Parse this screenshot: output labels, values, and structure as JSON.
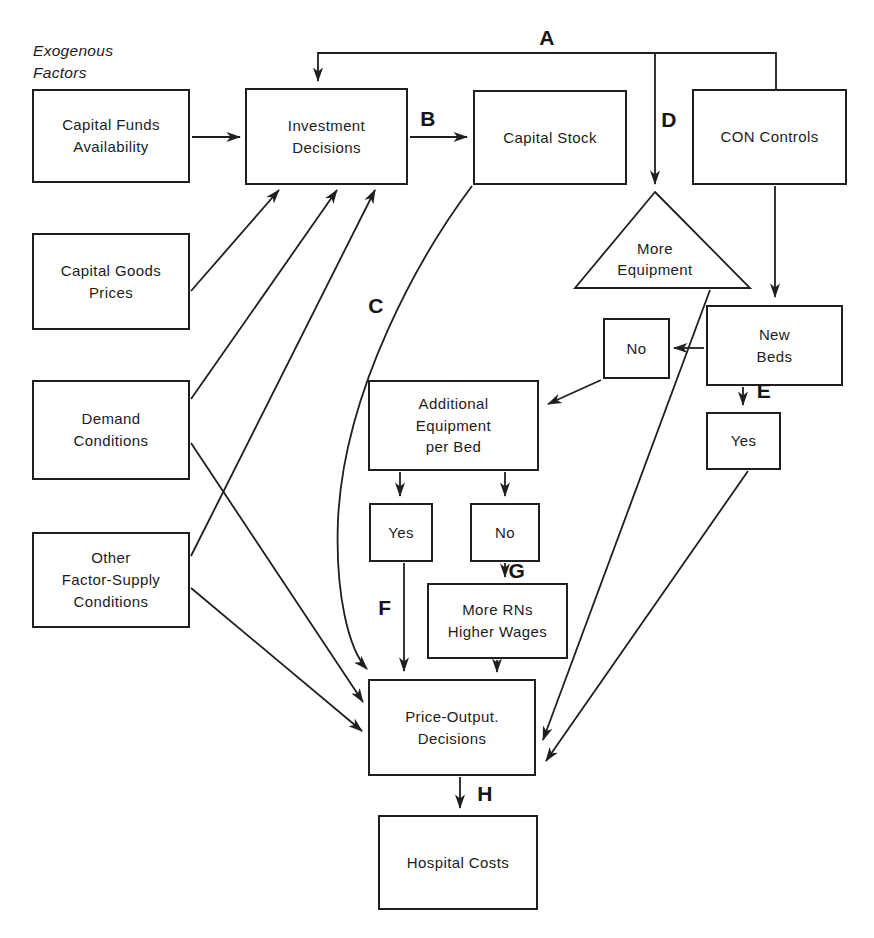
{
  "meta": {
    "figure_type": "flowchart",
    "topic": "hospital cost determination"
  },
  "colors": {
    "background": "#ffffff",
    "line": "#1f1f1f",
    "box_fill": "#ffffff",
    "text": "#1c1c1c"
  },
  "annotations": {
    "exogenous_factors": "Exogenous\nFactors"
  },
  "nodes": {
    "capital_funds_availability": {
      "label": "Capital Funds\nAvailability",
      "shape": "rect"
    },
    "investment_decisions": {
      "label": "Investment\nDecisions",
      "shape": "rect"
    },
    "capital_stock": {
      "label": "Capital Stock",
      "shape": "rect"
    },
    "con_controls": {
      "label": "CON Controls",
      "shape": "rect"
    },
    "capital_goods_prices": {
      "label": "Capital Goods\nPrices",
      "shape": "rect"
    },
    "demand_conditions": {
      "label": "Demand\nConditions",
      "shape": "rect"
    },
    "other_factor_supply_conditions": {
      "label": "Other\nFactor-Supply\nConditions",
      "shape": "rect"
    },
    "more_equipment": {
      "label": "More\nEquipment",
      "shape": "triangle"
    },
    "new_beds": {
      "label": "New\nBeds",
      "shape": "rect"
    },
    "no_new_beds": {
      "label": "No",
      "shape": "rect"
    },
    "yes_new_beds": {
      "label": "Yes",
      "shape": "rect"
    },
    "additional_equipment_per_bed": {
      "label": "Additional\nEquipment\nper Bed",
      "shape": "rect"
    },
    "yes_additional_equipment": {
      "label": "Yes",
      "shape": "rect"
    },
    "no_additional_equipment": {
      "label": "No",
      "shape": "rect"
    },
    "more_rns_higher_wages": {
      "label": "More RNs\nHigher Wages",
      "shape": "rect"
    },
    "price_output_decisions": {
      "label": "Price-Output.\nDecisions",
      "shape": "rect"
    },
    "hospital_costs": {
      "label": "Hospital Costs",
      "shape": "rect"
    }
  },
  "edge_labels": {
    "A": "A",
    "B": "B",
    "C": "C",
    "D": "D",
    "E": "E",
    "F": "F",
    "G": "G",
    "H": "H"
  },
  "edges": [
    {
      "from": "capital_funds_availability",
      "to": "investment_decisions",
      "label": ""
    },
    {
      "from": "con_controls",
      "to": "investment_decisions",
      "label": "A"
    },
    {
      "from": "investment_decisions",
      "to": "capital_stock",
      "label": "B"
    },
    {
      "from": "capital_stock",
      "to": "price_output_decisions",
      "label": "C"
    },
    {
      "from": "con_controls",
      "to": "more_equipment",
      "label": "D"
    },
    {
      "from": "con_controls",
      "to": "new_beds",
      "label": ""
    },
    {
      "from": "new_beds",
      "to": "no_new_beds",
      "label": ""
    },
    {
      "from": "new_beds",
      "to": "yes_new_beds",
      "label": "E"
    },
    {
      "from": "no_new_beds",
      "to": "additional_equipment_per_bed",
      "label": ""
    },
    {
      "from": "additional_equipment_per_bed",
      "to": "yes_additional_equipment",
      "label": ""
    },
    {
      "from": "additional_equipment_per_bed",
      "to": "no_additional_equipment",
      "label": ""
    },
    {
      "from": "yes_additional_equipment",
      "to": "price_output_decisions",
      "label": "F"
    },
    {
      "from": "no_additional_equipment",
      "to": "more_rns_higher_wages",
      "label": "G"
    },
    {
      "from": "more_rns_higher_wages",
      "to": "price_output_decisions",
      "label": ""
    },
    {
      "from": "more_equipment",
      "to": "price_output_decisions",
      "label": ""
    },
    {
      "from": "yes_new_beds",
      "to": "price_output_decisions",
      "label": ""
    },
    {
      "from": "capital_goods_prices",
      "to": "investment_decisions",
      "label": ""
    },
    {
      "from": "demand_conditions",
      "to": "investment_decisions",
      "label": ""
    },
    {
      "from": "other_factor_supply_conditions",
      "to": "investment_decisions",
      "label": ""
    },
    {
      "from": "demand_conditions",
      "to": "price_output_decisions",
      "label": ""
    },
    {
      "from": "other_factor_supply_conditions",
      "to": "price_output_decisions",
      "label": ""
    },
    {
      "from": "price_output_decisions",
      "to": "hospital_costs",
      "label": "H"
    }
  ]
}
